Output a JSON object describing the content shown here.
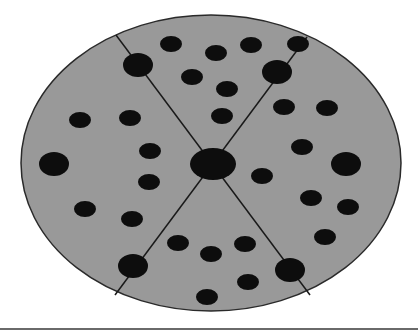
{
  "diagram": {
    "colors": {
      "background": "#ffffff",
      "disc_fill": "#999999",
      "disc_stroke": "#2a2a2a",
      "dot": "#0d0d0d",
      "line": "#1a1a1a",
      "bottom_rule": "#6a6a6a"
    },
    "disc": {
      "cx": 211,
      "cy": 163,
      "rx": 190,
      "ry": 148
    },
    "center_dot": {
      "cx": 213,
      "cy": 164,
      "rx": 23,
      "ry": 16
    },
    "dividing_lines": [
      {
        "x1": 116,
        "y1": 35,
        "x2": 310,
        "y2": 295
      },
      {
        "x1": 307,
        "y1": 37,
        "x2": 115,
        "y2": 295
      }
    ],
    "large_dots": [
      {
        "cx": 138,
        "cy": 65,
        "rx": 15,
        "ry": 12
      },
      {
        "cx": 277,
        "cy": 72,
        "rx": 15,
        "ry": 12
      },
      {
        "cx": 54,
        "cy": 164,
        "rx": 15,
        "ry": 12
      },
      {
        "cx": 346,
        "cy": 164,
        "rx": 15,
        "ry": 12
      },
      {
        "cx": 133,
        "cy": 266,
        "rx": 15,
        "ry": 12
      },
      {
        "cx": 290,
        "cy": 270,
        "rx": 15,
        "ry": 12
      }
    ],
    "small_dots": [
      {
        "cx": 171,
        "cy": 44
      },
      {
        "cx": 216,
        "cy": 53
      },
      {
        "cx": 251,
        "cy": 45
      },
      {
        "cx": 192,
        "cy": 77
      },
      {
        "cx": 227,
        "cy": 89
      },
      {
        "cx": 298,
        "cy": 44
      },
      {
        "cx": 80,
        "cy": 120
      },
      {
        "cx": 130,
        "cy": 118
      },
      {
        "cx": 150,
        "cy": 151
      },
      {
        "cx": 222,
        "cy": 116
      },
      {
        "cx": 284,
        "cy": 107
      },
      {
        "cx": 327,
        "cy": 108
      },
      {
        "cx": 149,
        "cy": 182
      },
      {
        "cx": 302,
        "cy": 147
      },
      {
        "cx": 262,
        "cy": 176
      },
      {
        "cx": 85,
        "cy": 209
      },
      {
        "cx": 132,
        "cy": 219
      },
      {
        "cx": 311,
        "cy": 198
      },
      {
        "cx": 348,
        "cy": 207
      },
      {
        "cx": 325,
        "cy": 237
      },
      {
        "cx": 178,
        "cy": 243
      },
      {
        "cx": 211,
        "cy": 254
      },
      {
        "cx": 245,
        "cy": 244
      },
      {
        "cx": 248,
        "cy": 282
      },
      {
        "cx": 207,
        "cy": 297
      }
    ],
    "small_dot_size": {
      "rx": 11,
      "ry": 8
    }
  }
}
